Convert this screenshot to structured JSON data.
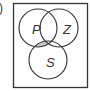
{
  "figure": {
    "partial_label": ")",
    "universal_set_box": {
      "x": 13.5,
      "y": 3.5,
      "width": 74,
      "height": 84
    },
    "sets": [
      {
        "name": "P",
        "label": "P",
        "cx": 38,
        "cy": 28,
        "r": 19,
        "label_x": 36,
        "label_y": 33
      },
      {
        "name": "Z",
        "label": "Z",
        "cx": 59,
        "cy": 28,
        "r": 19,
        "label_x": 66,
        "label_y": 33
      },
      {
        "name": "S",
        "label": "S",
        "cx": 48,
        "cy": 60,
        "r": 19,
        "label_x": 49,
        "label_y": 66
      }
    ],
    "shaded_region": "P ∩ S ∩ Z'",
    "colors": {
      "stroke": "#333333",
      "shade": "#c8c8c8",
      "background": "#ffffff"
    }
  }
}
